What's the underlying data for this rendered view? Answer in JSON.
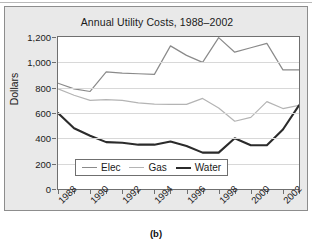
{
  "figure": {
    "caption": "(b)",
    "title": "Annual Utility Costs, 1988–2002"
  },
  "chart_data": {
    "type": "line",
    "title": "Annual Utility Costs, 1988–2002",
    "xlabel": "",
    "ylabel": "Dollars",
    "ylim": [
      0,
      1200
    ],
    "xlim": [
      1988,
      2003
    ],
    "grid": true,
    "legend_position": "bottom-center-inside",
    "y_ticks": [
      "0",
      "200",
      "400",
      "600",
      "800",
      "1,000",
      "1,200"
    ],
    "y_tick_values": [
      0,
      200,
      400,
      600,
      800,
      1000,
      1200
    ],
    "x_ticks": [
      "1988",
      "1990",
      "1992",
      "1994",
      "1996",
      "1998",
      "2000",
      "2002"
    ],
    "x_tick_values": [
      1988,
      1990,
      1992,
      1994,
      1996,
      1998,
      2000,
      2002
    ],
    "x": [
      1988,
      1989,
      1990,
      1991,
      1992,
      1993,
      1994,
      1995,
      1996,
      1997,
      1998,
      1999,
      2000,
      2001,
      2002,
      2003
    ],
    "series": [
      {
        "name": "Elec",
        "color": "#8a8a8a",
        "width": 1.2,
        "values": [
          835,
          790,
          770,
          925,
          915,
          910,
          905,
          1130,
          1055,
          1000,
          1195,
          1080,
          1115,
          1150,
          940,
          940
        ]
      },
      {
        "name": "Gas",
        "color": "#b4b4b4",
        "width": 1.2,
        "values": [
          790,
          740,
          700,
          705,
          700,
          680,
          670,
          668,
          668,
          715,
          640,
          535,
          565,
          690,
          635,
          660
        ]
      },
      {
        "name": "Water",
        "color": "#2b2b2b",
        "width": 2.1,
        "values": [
          600,
          480,
          420,
          370,
          365,
          350,
          350,
          375,
          340,
          287,
          287,
          400,
          345,
          345,
          470,
          660
        ]
      }
    ]
  },
  "legend": {
    "items": [
      {
        "label": "Elec",
        "color": "#8a8a8a",
        "width": 1.2
      },
      {
        "label": "Gas",
        "color": "#b4b4b4",
        "width": 1.2
      },
      {
        "label": "Water",
        "color": "#2b2b2b",
        "width": 2.1
      }
    ]
  }
}
